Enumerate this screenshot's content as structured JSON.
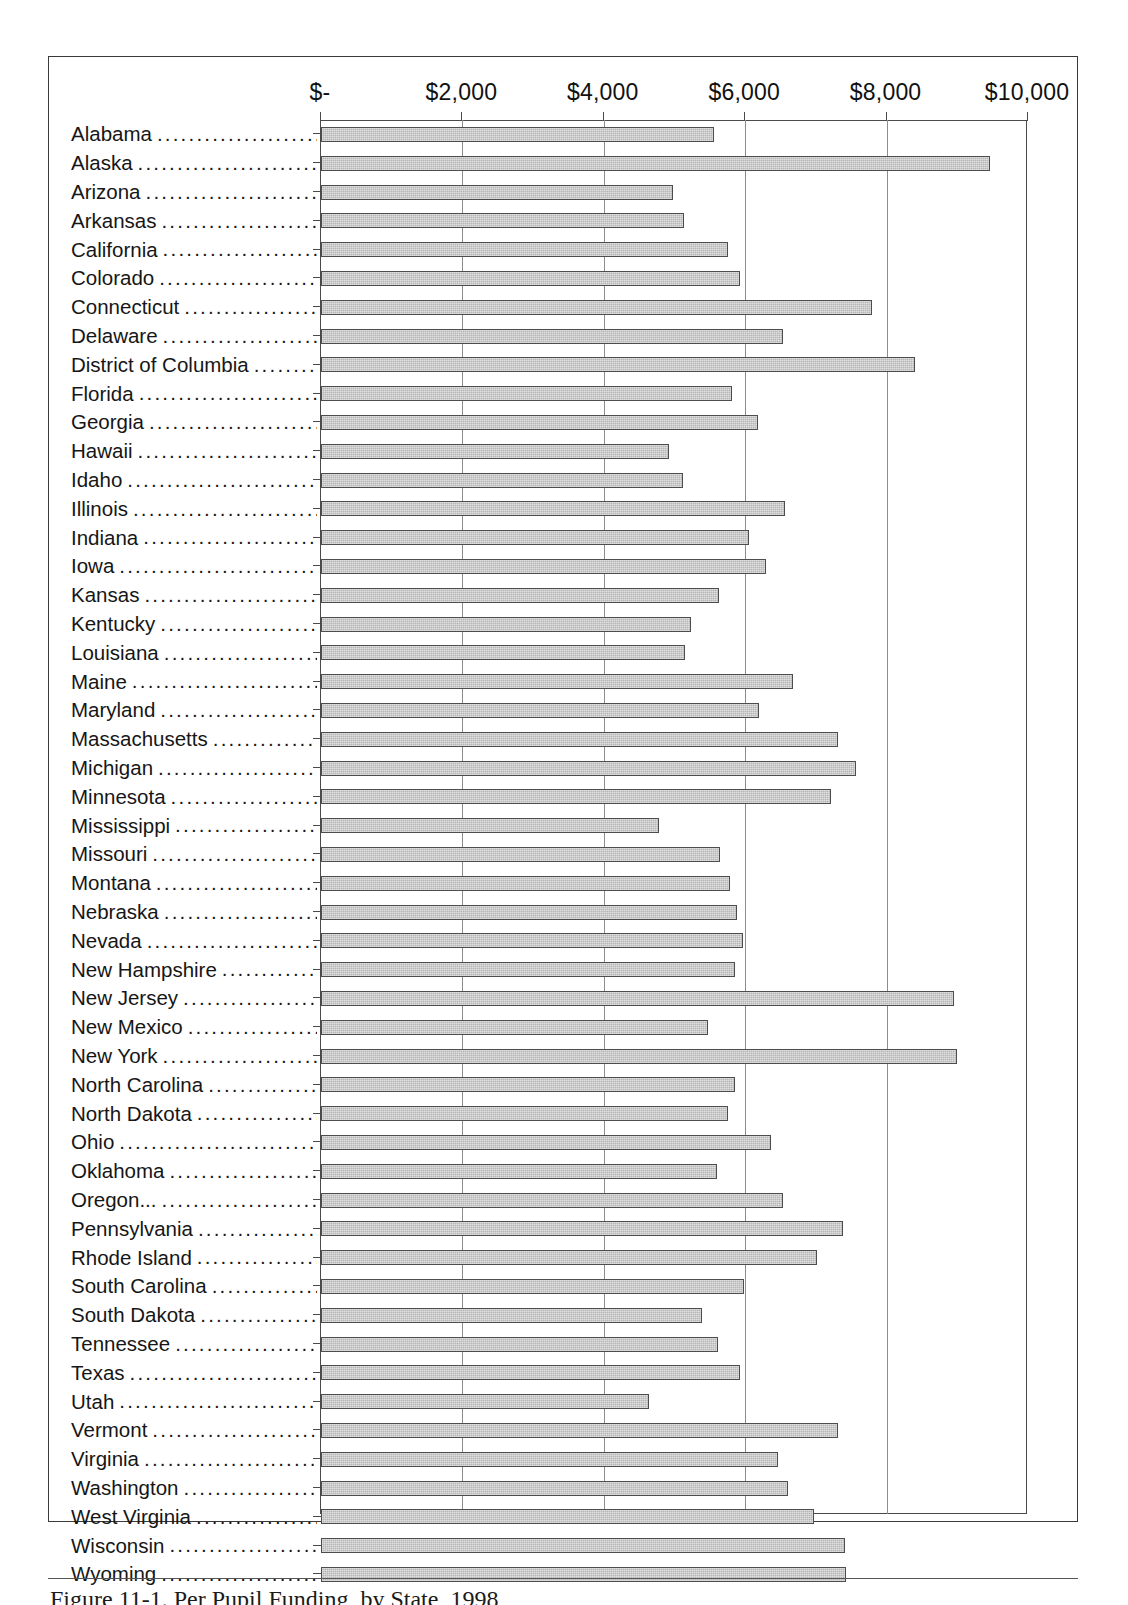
{
  "figure": {
    "caption": "Figure 11-1.  Per Pupil Funding, by State, 1998"
  },
  "chart_data": {
    "type": "bar",
    "orientation": "horizontal",
    "title": "Per Pupil Funding, by State, 1998",
    "xlabel": "",
    "ylabel": "",
    "xlim": [
      0,
      10000
    ],
    "xtick_labels": [
      "$-",
      "$2,000",
      "$4,000",
      "$6,000",
      "$8,000",
      "$10,000"
    ],
    "xtick_values": [
      0,
      2000,
      4000,
      6000,
      8000,
      10000
    ],
    "grid": true,
    "grid_axis": "x",
    "legend": false,
    "bar_fill_color": "#b6b6b6",
    "bar_edge_color": "#4d4d4d",
    "categories": [
      "Alabama",
      "Alaska",
      "Arizona",
      "Arkansas",
      "California",
      "Colorado",
      "Connecticut",
      "Delaware",
      "District of Columbia",
      "Florida",
      "Georgia",
      "Hawaii",
      "Idaho",
      "Illinois",
      "Indiana",
      "Iowa",
      "Kansas",
      "Kentucky",
      "Louisiana",
      "Maine",
      "Maryland",
      "Massachusetts",
      "Michigan",
      "Minnesota",
      "Mississippi",
      "Missouri",
      "Montana",
      "Nebraska",
      "Nevada",
      "New Hampshire",
      "New Jersey",
      "New Mexico",
      "New York",
      "North Carolina",
      "North Dakota",
      "Ohio",
      "Oklahoma",
      "Oregon...",
      "Pennsylvania",
      "Rhode Island",
      "South Carolina",
      "South Dakota",
      "Tennessee",
      "Texas",
      "Utah",
      "Vermont",
      "Virginia",
      "Washington",
      "West Virginia",
      "Wisconsin",
      "Wyoming"
    ],
    "values": [
      5560,
      9460,
      4980,
      5140,
      5760,
      5930,
      7790,
      6540,
      8400,
      5820,
      6180,
      4920,
      5120,
      6570,
      6050,
      6300,
      5630,
      5240,
      5150,
      6680,
      6190,
      7310,
      7570,
      7210,
      4780,
      5650,
      5780,
      5890,
      5970,
      5850,
      8960,
      5480,
      9000,
      5860,
      5750,
      6370,
      5600,
      6540,
      7390,
      7020,
      5990,
      5390,
      5610,
      5920,
      4640,
      7310,
      6460,
      6600,
      6980,
      7410,
      7420
    ]
  }
}
